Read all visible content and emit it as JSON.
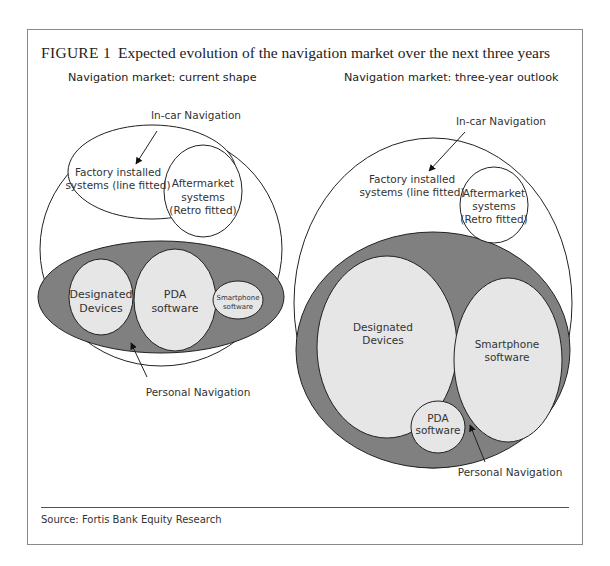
{
  "figure": {
    "label": "FIGURE 1",
    "title": "Expected evolution of the navigation market over the next three years",
    "source": "Source: Fortis Bank Equity Research"
  },
  "left_panel": {
    "title": "Navigation market: current shape",
    "in_car_label": "In-car Navigation",
    "factory_line1": "Factory installed",
    "factory_line2": "systems (line fitted)",
    "aftermarket_line1": "Aftermarket",
    "aftermarket_line2": "systems",
    "aftermarket_line3": "(Retro fitted)",
    "designated_line1": "Designated",
    "designated_line2": "Devices",
    "pda_line1": "PDA",
    "pda_line2": "software",
    "smartphone_line1": "Smartphone",
    "smartphone_line2": "software",
    "personal_label": "Personal Navigation"
  },
  "right_panel": {
    "title": "Navigation market: three-year outlook",
    "in_car_label": "In-car Navigation",
    "factory_line1": "Factory installed",
    "factory_line2": "systems (line fitted)",
    "aftermarket_line1": "Aftermarket",
    "aftermarket_line2": "systems",
    "aftermarket_line3": "(Retro fitted)",
    "designated_line1": "Designated",
    "designated_line2": "Devices",
    "smartphone_line1": "Smartphone",
    "smartphone_line2": "software",
    "pda_line1": "PDA",
    "pda_line2": "software",
    "personal_label": "Personal Navigation"
  },
  "colors": {
    "personal_fill": "#808080",
    "segment_fill": "#e6e6e6",
    "stroke": "#222222",
    "frame": "#8a8a8a"
  }
}
